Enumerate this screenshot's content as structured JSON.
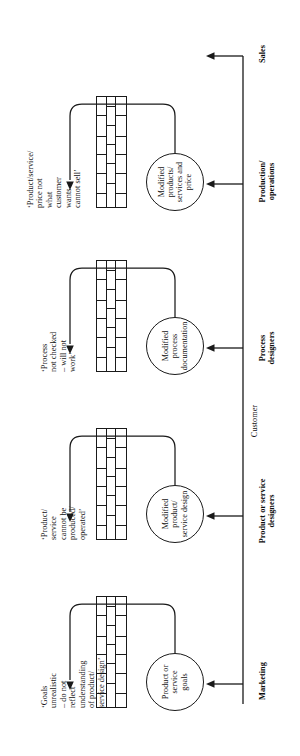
{
  "diagram": {
    "orientation": "rotated-90",
    "stages": [
      {
        "id": "marketing",
        "label": "Marketing",
        "circle_label": "Product or\nservice\ngoals",
        "quote": "‘Goals\nunrealistic\n– do not\nreflect\nunderstanding\nof product/\nservice design’"
      },
      {
        "id": "product-service-designers",
        "label": "Product or service\ndesigners",
        "circle_label": "Modified\nproduct/\nservice design",
        "quote": "‘Product/\nservice\ncannot be\nproduced/\noperated’"
      },
      {
        "id": "process-designers",
        "label": "Process\ndesigners",
        "circle_label": "Modified\nprocess\ndocumentation",
        "quote": "‘Process\nnot checked\n– will not\nwork’"
      },
      {
        "id": "production-operations",
        "label": "Production/\noperations",
        "circle_label": "Modified\nproducts/\nservices and\nprice",
        "quote": "‘Product/service/\nprice not\nwhat\ncustomer\nwants –\ncannot sell’"
      },
      {
        "id": "sales",
        "label": "Sales",
        "circle_label": "",
        "quote": ""
      }
    ],
    "spine_label": "Customer",
    "colors": {
      "ink": "#1a1a1a",
      "paper": "#ffffff"
    }
  }
}
